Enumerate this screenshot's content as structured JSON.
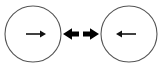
{
  "diagram": {
    "canvas": {
      "width": 162,
      "height": 72,
      "background": "#ffffff"
    },
    "colors": {
      "circle_stroke": "#555555",
      "inner_arrow": "#111111",
      "center_arrow": "#000000",
      "background": "#ffffff"
    },
    "nodes": [
      {
        "id": "left-body",
        "label": "",
        "shape": "circle",
        "cx": 33,
        "cy": 34,
        "r": 28,
        "stroke": "#555555",
        "stroke_width": 1,
        "fill": "none",
        "inner_arrow": {
          "name": "right-arrow-icon",
          "direction": "right",
          "x1": 26,
          "x2": 46,
          "y": 34,
          "style": "thin-shaft-solid-head"
        }
      },
      {
        "id": "right-body",
        "label": "",
        "shape": "circle",
        "cx": 129,
        "cy": 34,
        "r": 28,
        "stroke": "#555555",
        "stroke_width": 1,
        "fill": "none",
        "inner_arrow": {
          "name": "left-arrow-icon",
          "direction": "left",
          "x1": 136,
          "x2": 116,
          "y": 34,
          "style": "thin-shaft-solid-head"
        }
      }
    ],
    "center_arrows": [
      {
        "id": "outward-left",
        "name": "bold-left-arrow-icon",
        "direction": "left",
        "tail_x": 79,
        "tip_x": 63,
        "y": 34,
        "color": "#000000",
        "style": "bold"
      },
      {
        "id": "outward-right",
        "name": "bold-right-arrow-icon",
        "direction": "right",
        "tail_x": 83,
        "tip_x": 99,
        "y": 34,
        "color": "#000000",
        "style": "bold"
      }
    ]
  }
}
